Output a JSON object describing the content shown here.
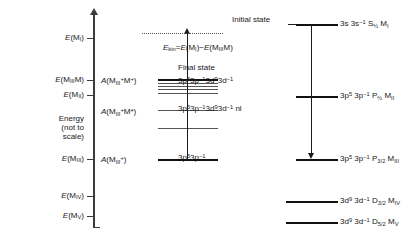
{
  "figure": {
    "axis": {
      "label_lines": [
        "Energy",
        "(not to",
        "scale)"
      ],
      "ticks": [
        {
          "label": "E(M_I)",
          "html": "<i>E</i>(M<sub>I</sub>)"
        },
        {
          "label": "E(M_III M)",
          "html": "<i>E</i>(M<sub>III</sub>M)"
        },
        {
          "label": "E(M_II)",
          "html": "<i>E</i>(M<sub>II</sub>)"
        },
        {
          "label": "E(M_III)",
          "html": "<i>E</i>(M<sub>III</sub>)"
        },
        {
          "label": "E(M_IV)",
          "html": "<i>E</i>(M<sub>IV</sub>)"
        },
        {
          "label": "E(M_V)",
          "html": "<i>E</i>(M<sub>V</sub>)"
        }
      ]
    },
    "amplitude_labels": [
      {
        "id": "a-miii-plus-m-plus",
        "html": "<i>A</i>(M<sub>III</sub><sup>+</sup>M<sup>+</sup>)"
      },
      {
        "id": "a-miii-plus-m-star",
        "html": "<i>A</i>(M<sub>III</sub><sup>+</sup>M*)"
      },
      {
        "id": "a-miii-plus",
        "html": "<i>A</i>(M<sub>III</sub><sup>+</sup>)"
      }
    ],
    "center": {
      "ekin": "E_kin = E(M_I) - E(M_III M)",
      "ekin_html": "<i>E</i><sub>kin</sub>=<i>E</i>(M<sub>I</sub>)&#8722;<i>E</i>(M<sub>III</sub>M)",
      "final_state": "Final state",
      "config_final": "3p5 3p-1 3d9 3d-1",
      "config_final_html": "3p<sup>5</sup>3p<sup>&#8722;1</sup>3d<sup>9</sup>3d<sup>&#8722;1</sup>",
      "config_shakeup": "3p5 3p-1 3d9 3d-1 nl",
      "config_shakeup_html": "3p<sup>5</sup>3p<sup>&#8722;1</sup>3d<sup>9</sup>3d<sup>&#8722;1</sup> nl",
      "config_core": "3p5 3p-1",
      "config_core_html": "3p<sup>5</sup>3p<sup>&#8722;1</sup>"
    },
    "right": {
      "initial_state": "Initial state",
      "levels": [
        {
          "id": "m-i",
          "text": "3s 3s-1 S1/2 M_I",
          "html": "3s 3s<sup>&#8722;1</sup> S<sub>&#189;</sub> M<sub>I</sub>"
        },
        {
          "id": "m-ii",
          "text": "3p5 3p-1 P1/2 M_II",
          "html": "3p<sup>5</sup> 3p<sup>&#8722;1</sup> P<sub>&#189;</sub> M<sub>II</sub>"
        },
        {
          "id": "m-iii",
          "text": "3p5 3p-1 P3/2 M_III",
          "html": "3p<sup>5</sup> 3p<sup>&#8722;1</sup> P<sub>3/2</sub> M<sub>III</sub>"
        },
        {
          "id": "m-iv",
          "text": "3d9 3d-1 D3/2 M_IV",
          "html": "3d<sup>9</sup> 3d<sup>&#8722;1</sup> D<sub>3/2</sub> M<sub>IV</sub>"
        },
        {
          "id": "m-v",
          "text": "3d9 3d-1 D5/2 M_V",
          "html": "3d<sup>9</sup> 3d<sup>&#8722;1</sup> D<sub>5/2</sub> M<sub>V</sub>"
        }
      ]
    },
    "colors": {
      "ink": "#111111",
      "axis": "#3b3b3b",
      "faint": "#555555",
      "background": "#ffffff"
    }
  }
}
